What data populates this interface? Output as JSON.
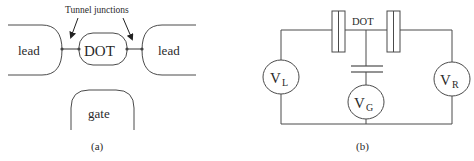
{
  "panel_a": {
    "caption": "(a)",
    "annotation": "Tunnel junctions",
    "lead_left": "lead",
    "lead_right": "lead",
    "dot": "DOT",
    "gate": "gate"
  },
  "panel_b": {
    "caption": "(b)",
    "dot_label": "DOT",
    "sources": [
      {
        "symbol": "V",
        "subscript": "L"
      },
      {
        "symbol": "V",
        "subscript": "G"
      },
      {
        "symbol": "V",
        "subscript": "R"
      }
    ]
  }
}
